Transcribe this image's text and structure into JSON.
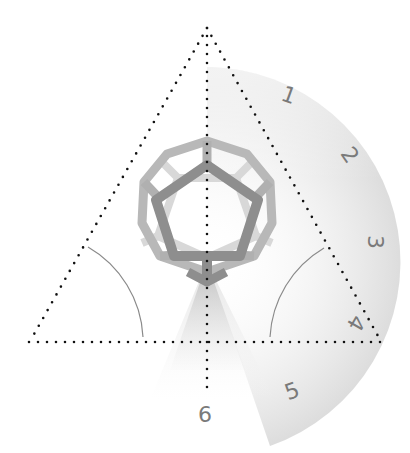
{
  "diagram": {
    "type": "dodecahedron-viewing-angles",
    "labels": [
      "1",
      "2",
      "3",
      "4",
      "5",
      "6"
    ],
    "label_positions": [
      {
        "label": "1",
        "x": 289,
        "y": 95,
        "rotate": 20
      },
      {
        "label": "2",
        "x": 350,
        "y": 155,
        "rotate": 50
      },
      {
        "label": "3",
        "x": 375,
        "y": 242,
        "rotate": 90
      },
      {
        "label": "4",
        "x": 357,
        "y": 324,
        "rotate": 120
      },
      {
        "label": "5",
        "x": 292,
        "y": 392,
        "rotate": 160
      },
      {
        "label": "6",
        "x": 205,
        "y": 414,
        "rotate": 0
      }
    ],
    "colors": {
      "dots": "#111111",
      "front_pentagon": "#8c8c8c",
      "outer_ring": "#b4b4b4",
      "back_edges": "#d6d6d6",
      "arc_line": "#8a8a8a",
      "label": "#7a7a7a",
      "shade": "#cfcfcf"
    }
  }
}
